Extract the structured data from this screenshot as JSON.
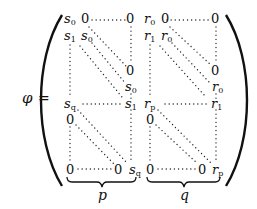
{
  "equation": {
    "lhs": "φ",
    "equals": "=",
    "left_block": {
      "top_left": {
        "sym": "s",
        "sub": "0"
      },
      "row0_first_zero": "0",
      "row0_last_zero": "0",
      "row1_first": {
        "sym": "s",
        "sub": "1"
      },
      "row1_second": {
        "sym": "s",
        "sub": "0"
      },
      "mid_zero": "0",
      "mid_s0": {
        "sym": "s",
        "sub": "0"
      },
      "row_q_first": {
        "sym": "s",
        "sub": "q"
      },
      "row_q_last": {
        "sym": "s",
        "sub": "1"
      },
      "lower_top_zero": "0",
      "bottom_left_zero": "0",
      "bottom_mid_zero": "0",
      "bottom_right": {
        "sym": "s",
        "sub": "q"
      },
      "brace_label": "p"
    },
    "right_block": {
      "top_left": {
        "sym": "r",
        "sub": "0"
      },
      "row0_first_zero": "0",
      "row0_last_zero": "0",
      "row1_first": {
        "sym": "r",
        "sub": "1"
      },
      "row1_second": {
        "sym": "r",
        "sub": "0"
      },
      "mid_zero": "0",
      "mid_r0": {
        "sym": "r",
        "sub": "0"
      },
      "row_p_first": {
        "sym": "r",
        "sub": "p"
      },
      "row_p_last": {
        "sym": "r",
        "sub": "1"
      },
      "lower_top_zero": "0",
      "bottom_left_zero": "0",
      "bottom_mid_zero": "0",
      "bottom_right": {
        "sym": "r",
        "sub": "p"
      },
      "brace_label": "q"
    }
  }
}
